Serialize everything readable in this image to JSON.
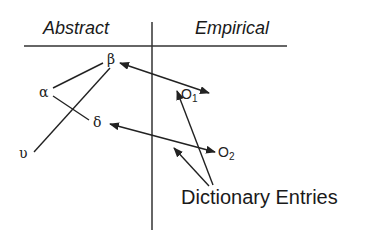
{
  "diagram": {
    "headers": {
      "left": "Abstract",
      "right": "Empirical"
    },
    "abstract_nodes": [
      {
        "id": "beta",
        "label": "β"
      },
      {
        "id": "alpha",
        "label": "α"
      },
      {
        "id": "delta",
        "label": "δ"
      },
      {
        "id": "upsilon",
        "label": "υ"
      }
    ],
    "empirical_nodes": [
      {
        "id": "O1",
        "label": "O",
        "subscript": "1"
      },
      {
        "id": "O2",
        "label": "O",
        "subscript": "2"
      }
    ],
    "caption": "Dictionary Entries",
    "edges": [
      {
        "from": "alpha",
        "to": "beta",
        "type": "line"
      },
      {
        "from": "alpha",
        "to": "delta",
        "type": "line"
      },
      {
        "from": "upsilon",
        "to": "beta",
        "type": "line"
      },
      {
        "from": "beta",
        "to": "O1",
        "type": "double-arrow"
      },
      {
        "from": "delta",
        "to": "O2",
        "type": "double-arrow"
      },
      {
        "from": "Dictionary Entries",
        "to": "O1",
        "type": "arrow"
      },
      {
        "from": "Dictionary Entries",
        "to": "between-O1-O2",
        "type": "arrow"
      }
    ],
    "colors": {
      "ink": "#222222",
      "background": "#ffffff"
    }
  }
}
